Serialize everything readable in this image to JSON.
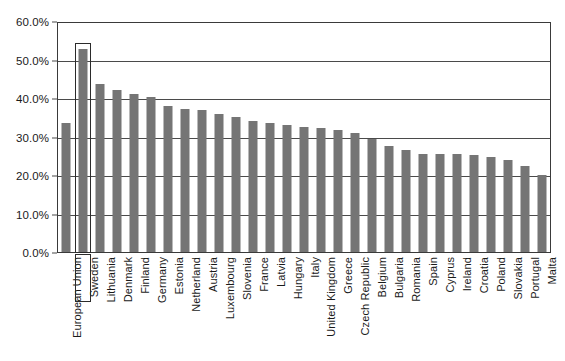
{
  "chart_data": {
    "type": "bar",
    "title": "",
    "xlabel": "",
    "ylabel": "",
    "ylim": [
      0,
      60
    ],
    "ytick_labels": [
      "0.0%",
      "10.0%",
      "20.0%",
      "30.0%",
      "40.0%",
      "50.0%",
      "60.0%"
    ],
    "ytick_values": [
      0,
      10,
      20,
      30,
      40,
      50,
      60
    ],
    "grid": true,
    "legend": "none",
    "bar_color": "#757575",
    "highlight": "Sweden",
    "categories": [
      "European Union",
      "Sweden",
      "Lithuania",
      "Denmark",
      "Finland",
      "Germany",
      "Estonia",
      "Netherland",
      "Austria",
      "Luxembourg",
      "Slovenia",
      "France",
      "Latvia",
      "Hungary",
      "Italy",
      "United Kingdom",
      "Greece",
      "Czech Republic",
      "Belgium",
      "Bulgaria",
      "Romania",
      "Spain",
      "Cyprus",
      "Ireland",
      "Croatia",
      "Poland",
      "Slovakia",
      "Portugal",
      "Malta"
    ],
    "values": [
      33.8,
      53.2,
      43.9,
      42.5,
      41.5,
      40.6,
      38.2,
      37.4,
      37.2,
      36.2,
      35.4,
      34.2,
      33.9,
      33.3,
      32.7,
      32.4,
      31.9,
      31.2,
      29.6,
      27.8,
      26.8,
      25.6,
      25.6,
      25.6,
      25.5,
      24.8,
      24.0,
      22.6,
      20.2
    ]
  }
}
